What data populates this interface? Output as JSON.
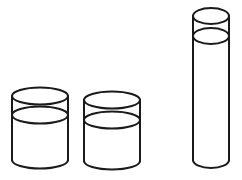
{
  "figure": {
    "type": "line-drawing",
    "width": 242,
    "height": 180,
    "background_color": "#ffffff",
    "stroke_color": "#1a1a1a",
    "stroke_width": 2,
    "objects": [
      {
        "id": "cylinder-left",
        "label": "Left short wide cylinder",
        "shape": "cylinder",
        "center_x": 40,
        "half_width": 28,
        "ellipse_ry": 8.5,
        "top_y": 96,
        "bottom_y": 160,
        "fill_line_y": 115,
        "has_fill_line": true
      },
      {
        "id": "cylinder-middle",
        "label": "Middle short wide cylinder",
        "shape": "cylinder",
        "center_x": 112,
        "half_width": 28,
        "ellipse_ry": 8.5,
        "top_y": 100,
        "bottom_y": 161,
        "fill_line_y": 120,
        "has_fill_line": true
      },
      {
        "id": "cylinder-right-tall",
        "label": "Right tall narrow cylinder",
        "shape": "cylinder",
        "center_x": 211,
        "half_width": 18,
        "ellipse_ry": 8,
        "top_y": 16,
        "bottom_y": 160,
        "fill_line_y": 36,
        "has_fill_line": true
      }
    ]
  }
}
